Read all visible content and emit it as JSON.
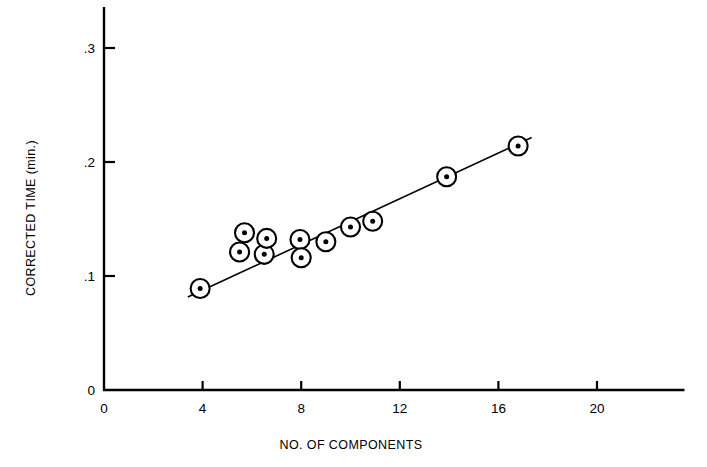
{
  "chart_data": {
    "type": "scatter",
    "title": "",
    "xlabel": "NO. OF COMPONENTS",
    "ylabel": "CORRECTED TIME (min.)",
    "xlim": [
      0,
      23.5
    ],
    "ylim": [
      0,
      0.335
    ],
    "xticks": [
      0,
      4,
      8,
      12,
      16,
      20
    ],
    "xtick_labels": [
      "0",
      "4",
      "8",
      "12",
      "16",
      "20"
    ],
    "yticks": [
      0,
      0.1,
      0.2,
      0.3
    ],
    "ytick_labels": [
      "0",
      ".1",
      ".2",
      ".3"
    ],
    "grid": false,
    "legend": null,
    "marker_style": "open-circle-with-center-dot",
    "points": [
      {
        "x": 3.9,
        "y": 0.089
      },
      {
        "x": 5.5,
        "y": 0.121
      },
      {
        "x": 5.7,
        "y": 0.138
      },
      {
        "x": 6.5,
        "y": 0.119
      },
      {
        "x": 6.6,
        "y": 0.133
      },
      {
        "x": 7.95,
        "y": 0.132
      },
      {
        "x": 8.0,
        "y": 0.116
      },
      {
        "x": 9.0,
        "y": 0.13
      },
      {
        "x": 10.0,
        "y": 0.143
      },
      {
        "x": 10.9,
        "y": 0.148
      },
      {
        "x": 13.9,
        "y": 0.187
      },
      {
        "x": 16.8,
        "y": 0.214
      }
    ],
    "fit_line": {
      "x_start": 3.4,
      "y_start": 0.0815,
      "x_end": 17.35,
      "y_end": 0.2215
    }
  },
  "axes": {
    "x_axis_name": "x-axis",
    "y_axis_name": "y-axis"
  }
}
